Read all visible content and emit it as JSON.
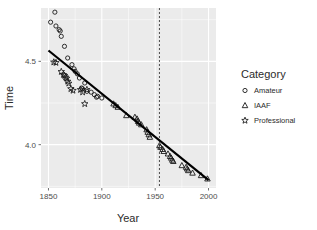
{
  "chart_data": {
    "type": "scatter",
    "title": "",
    "xlabel": "Year",
    "ylabel": "Time",
    "xlim": [
      1843,
      2007
    ],
    "ylim": [
      3.74,
      4.82
    ],
    "xticks": [
      1850,
      1900,
      1950,
      2000
    ],
    "xtick_labels": [
      "1850",
      "1900",
      "1950",
      "2000"
    ],
    "yticks": [
      4.0,
      4.5
    ],
    "ytick_labels": [
      "4.0",
      "4.5"
    ],
    "grid": true,
    "panel_background": "#ebebeb",
    "grid_color": "#ffffff",
    "legend": {
      "title": "Category",
      "position": "right",
      "entries": [
        {
          "label": "Amateur",
          "marker": "circle"
        },
        {
          "label": "IAAF",
          "marker": "triangle"
        },
        {
          "label": "Professional",
          "marker": "star"
        }
      ]
    },
    "annotations": [
      {
        "type": "vline",
        "x": 1954,
        "style": "dashed",
        "color": "#4d4d4d"
      },
      {
        "type": "trendline",
        "x": [
          1850,
          2000
        ],
        "y": [
          4.565,
          3.787
        ],
        "color": "#000000",
        "width": 2.2
      }
    ],
    "series": [
      {
        "name": "Amateur",
        "marker": "circle",
        "color": "#1a1a1a",
        "points": [
          [
            1852,
            4.735
          ],
          [
            1856,
            4.795
          ],
          [
            1857,
            4.712
          ],
          [
            1860,
            4.69
          ],
          [
            1861,
            4.682
          ],
          [
            1862,
            4.65
          ],
          [
            1865,
            4.59
          ],
          [
            1868,
            4.52
          ],
          [
            1872,
            4.48
          ],
          [
            1874,
            4.455
          ],
          [
            1875,
            4.44
          ],
          [
            1877,
            4.425
          ],
          [
            1879,
            4.4
          ],
          [
            1881,
            4.34
          ],
          [
            1882,
            4.335
          ],
          [
            1884,
            4.37
          ],
          [
            1886,
            4.32
          ],
          [
            1890,
            4.315
          ],
          [
            1893,
            4.3
          ],
          [
            1895,
            4.285
          ],
          [
            1896,
            4.29
          ],
          [
            1900,
            4.28
          ]
        ]
      },
      {
        "name": "Professional",
        "marker": "star",
        "color": "#1a1a1a",
        "points": [
          [
            1855,
            4.495
          ],
          [
            1857,
            4.492
          ],
          [
            1862,
            4.438
          ],
          [
            1864,
            4.42
          ],
          [
            1865,
            4.415
          ],
          [
            1866,
            4.405
          ],
          [
            1867,
            4.398
          ],
          [
            1868,
            4.38
          ],
          [
            1869,
            4.368
          ],
          [
            1871,
            4.335
          ],
          [
            1873,
            4.325
          ],
          [
            1880,
            4.33
          ],
          [
            1882,
            4.315
          ],
          [
            1884,
            4.245
          ],
          [
            1886,
            4.33
          ]
        ]
      },
      {
        "name": "IAAF",
        "marker": "triangle",
        "color": "#1a1a1a",
        "points": [
          [
            1911,
            4.245
          ],
          [
            1913,
            4.235
          ],
          [
            1915,
            4.225
          ],
          [
            1923,
            4.175
          ],
          [
            1931,
            4.165
          ],
          [
            1933,
            4.155
          ],
          [
            1934,
            4.14
          ],
          [
            1935,
            4.13
          ],
          [
            1937,
            4.12
          ],
          [
            1942,
            4.09
          ],
          [
            1943,
            4.075
          ],
          [
            1944,
            4.06
          ],
          [
            1945,
            4.045
          ],
          [
            1954,
            3.995
          ],
          [
            1955,
            3.985
          ],
          [
            1957,
            3.972
          ],
          [
            1958,
            3.96
          ],
          [
            1962,
            3.945
          ],
          [
            1964,
            3.93
          ],
          [
            1965,
            3.92
          ],
          [
            1966,
            3.908
          ],
          [
            1967,
            3.9
          ],
          [
            1975,
            3.875
          ],
          [
            1979,
            3.865
          ],
          [
            1980,
            3.855
          ],
          [
            1981,
            3.845
          ],
          [
            1985,
            3.83
          ],
          [
            1993,
            3.815
          ],
          [
            1999,
            3.795
          ]
        ]
      }
    ]
  }
}
